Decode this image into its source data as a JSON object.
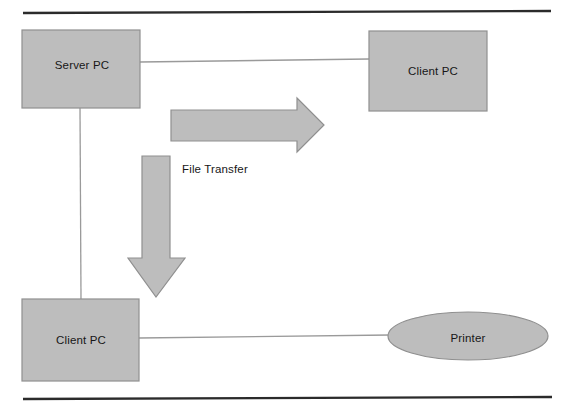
{
  "diagram": {
    "background_color": "#ffffff",
    "shape_fill_color": "#bdbdbd",
    "shape_stroke_color": "#8f8f8f",
    "rule_color": "#2b2b2b",
    "connector_color": "#9a9a9a",
    "text_color": "#171717",
    "rules": [
      {
        "name": "top-rule",
        "x1": 23,
        "y1": 13,
        "x2": 551,
        "y2": 11
      },
      {
        "name": "bottom-rule",
        "x1": 23,
        "y1": 399,
        "x2": 552,
        "y2": 397
      }
    ],
    "nodes": [
      {
        "id": "server-pc",
        "label": "Server PC",
        "shape": "rectangle",
        "x": 22,
        "y": 30,
        "width": 118,
        "height": 78,
        "label_x": 82,
        "label_y": 66
      },
      {
        "id": "client-pc-top",
        "label": "Client PC",
        "shape": "rectangle",
        "x": 369,
        "y": 31,
        "width": 118,
        "height": 80,
        "label_x": 433,
        "label_y": 72
      },
      {
        "id": "client-pc-bottom",
        "label": "Client PC",
        "shape": "rectangle",
        "x": 22,
        "y": 299,
        "width": 117,
        "height": 82,
        "label_x": 81,
        "label_y": 341
      },
      {
        "id": "printer",
        "label": "Printer",
        "shape": "ellipse",
        "cx": 468,
        "cy": 336,
        "rx": 80,
        "ry": 24,
        "label_x": 468,
        "label_y": 339
      }
    ],
    "connectors": [
      {
        "id": "server-to-client-top",
        "from": "server-pc",
        "to": "client-pc-top",
        "x1": 140,
        "y1": 62,
        "x2": 369,
        "y2": 59
      },
      {
        "id": "server-to-client-bottom",
        "from": "server-pc",
        "to": "client-pc-bottom",
        "x1": 80,
        "y1": 108,
        "x2": 81,
        "y2": 299
      },
      {
        "id": "client-bottom-to-printer",
        "from": "client-pc-bottom",
        "to": "printer",
        "x1": 139,
        "y1": 338,
        "x2": 390,
        "y2": 335
      }
    ],
    "arrows": [
      {
        "id": "file-transfer-right-arrow",
        "direction": "right",
        "points": "171,110 297,110 297,98 324,125 297,152 297,141 171,141",
        "label": "File Transfer",
        "label_x": 182,
        "label_y": 170
      },
      {
        "id": "file-transfer-down-arrow",
        "direction": "down",
        "points": "142,156 170,156 170,258 185,258 156,297 128,258 142,258"
      }
    ]
  }
}
